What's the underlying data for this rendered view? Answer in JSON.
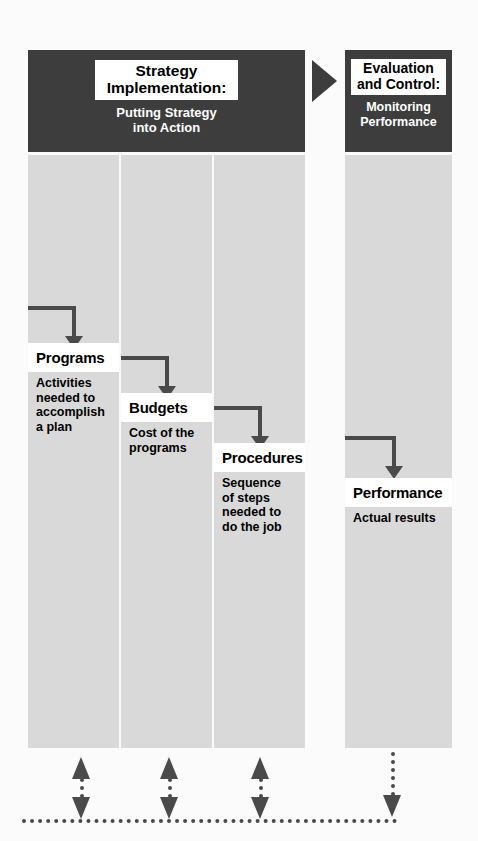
{
  "diagram": {
    "colors": {
      "banner_dark": "#3d3d3d",
      "column_gray": "#d9d9d9",
      "arrow_gray": "#4a4a4a",
      "label_white": "#ffffff",
      "page_background": "#fbfbfb"
    }
  },
  "banners": {
    "main": {
      "title_line1": "Strategy",
      "title_line2": "Implementation:",
      "subtitle_line1": "Putting Strategy",
      "subtitle_line2": "into Action"
    },
    "right": {
      "title_line1": "Evaluation",
      "title_line2": "and Control:",
      "subtitle_line1": "Monitoring",
      "subtitle_line2": "Performance"
    }
  },
  "connector": {
    "icon": "right-triangle-arrow-icon"
  },
  "stages": [
    {
      "key": "programs",
      "label": "Programs",
      "description_lines": [
        "Activities",
        "needed to",
        "accomplish",
        "a plan"
      ]
    },
    {
      "key": "budgets",
      "label": "Budgets",
      "description_lines": [
        "Cost of the",
        "programs"
      ]
    },
    {
      "key": "procedures",
      "label": "Procedures",
      "description_lines": [
        "Sequence",
        "of steps",
        "needed to",
        "do the job"
      ]
    },
    {
      "key": "performance",
      "label": "Performance",
      "description_lines": [
        "Actual results"
      ]
    }
  ],
  "feedback": {
    "loop_name": "feedback-loop",
    "arrows": [
      {
        "key": "programs-feedback",
        "type": "double-headed-vertical-arrow-icon"
      },
      {
        "key": "budgets-feedback",
        "type": "double-headed-vertical-arrow-icon"
      },
      {
        "key": "procedures-feedback",
        "type": "double-headed-vertical-arrow-icon"
      },
      {
        "key": "performance-feedback",
        "type": "down-arrow-icon"
      }
    ],
    "baseline": "dotted-feedback-line"
  },
  "flow_arrows": [
    {
      "key": "into-programs",
      "icon": "elbow-down-arrow-icon"
    },
    {
      "key": "programs-to-budgets",
      "icon": "elbow-down-arrow-icon"
    },
    {
      "key": "budgets-to-procedures",
      "icon": "elbow-down-arrow-icon"
    },
    {
      "key": "into-performance",
      "icon": "elbow-down-arrow-icon"
    }
  ]
}
